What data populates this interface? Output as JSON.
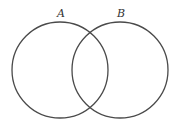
{
  "diagram": {
    "type": "venn",
    "sets": [
      {
        "label": "A",
        "cx": 60,
        "cy": 70,
        "r": 48,
        "label_x": 61,
        "label_y": 17
      },
      {
        "label": "B",
        "cx": 120,
        "cy": 70,
        "r": 48,
        "label_x": 121,
        "label_y": 17
      }
    ],
    "stroke_color": "#4a4a4a",
    "label_color": "#333333",
    "background": "#ffffff"
  }
}
